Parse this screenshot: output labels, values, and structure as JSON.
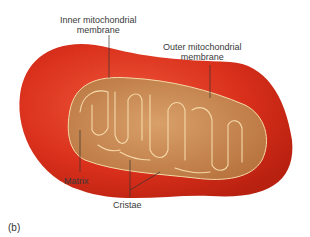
{
  "figure": {
    "panel_label": "(b)",
    "labels": {
      "inner_membrane_line1": "Inner mitochondrial",
      "inner_membrane_line2": "membrane",
      "outer_membrane_line1": "Outer mitochondrial",
      "outer_membrane_line2": "membrane",
      "matrix": "Matrix",
      "cristae": "Cristae"
    },
    "colors": {
      "outer_membrane": "#d9301c",
      "outer_highlight": "#f0583a",
      "inner_fill": "#c98a52",
      "cristae_line": "#f5d9a8",
      "leader_line": "#333333",
      "text": "#3a3a3a"
    }
  }
}
